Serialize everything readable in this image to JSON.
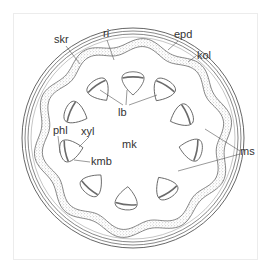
{
  "diagram": {
    "type": "stem-cross-section",
    "colors": {
      "line": "#555555",
      "stipple": "#9a9a9a",
      "label": "#333333",
      "background": "#ffffff"
    },
    "center": [
      133,
      138
    ],
    "rings": {
      "epidermis_r": 110,
      "collenchyma_r": [
        107,
        104
      ],
      "cortex_inner_r": 101
    },
    "sclerenchyma": {
      "r_outer": 96,
      "r_inner": 88,
      "waves": 10,
      "amplitude": 4
    },
    "bundles": [
      {
        "angle": -90,
        "r": 56
      },
      {
        "angle": -125,
        "r": 59
      },
      {
        "angle": -58,
        "r": 57
      },
      {
        "angle": -157,
        "r": 63
      },
      {
        "angle": -24,
        "r": 54
      },
      {
        "angle": 169,
        "r": 64
      },
      {
        "angle": 11,
        "r": 60
      },
      {
        "angle": 131,
        "r": 62
      },
      {
        "angle": 57,
        "r": 60
      },
      {
        "angle": 96,
        "r": 62
      }
    ],
    "labels": [
      {
        "id": "ri",
        "text": "ri",
        "x": 103,
        "y": 37
      },
      {
        "id": "skr",
        "text": "skr",
        "x": 54,
        "y": 43
      },
      {
        "id": "epd",
        "text": "epd",
        "x": 174,
        "y": 38
      },
      {
        "id": "kol",
        "text": "kol",
        "x": 197,
        "y": 59
      },
      {
        "id": "lb",
        "text": "lb",
        "x": 118,
        "y": 116
      },
      {
        "id": "phl",
        "text": "phl",
        "x": 53,
        "y": 134
      },
      {
        "id": "xyl",
        "text": "xyl",
        "x": 81,
        "y": 135
      },
      {
        "id": "mk",
        "text": "mk",
        "x": 122,
        "y": 148
      },
      {
        "id": "kmb",
        "text": "kmb",
        "x": 91,
        "y": 165
      },
      {
        "id": "ms",
        "text": "ms",
        "x": 240,
        "y": 155
      }
    ]
  }
}
